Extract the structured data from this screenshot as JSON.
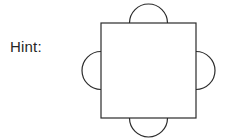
{
  "page": {
    "background_color": "#ffffff",
    "width": 230,
    "height": 139
  },
  "label": {
    "hint_text": "Hint:",
    "color": "#262626",
    "font_size_px": 15
  },
  "figure": {
    "name": "square-with-four-outward-semicircles",
    "stroke_color": "#2b2b2b",
    "fill_color": "#ffffff",
    "stroke_width_px": 1.2,
    "square": {
      "x": 101,
      "y": 23,
      "width": 95,
      "height": 95
    },
    "semicircles": [
      {
        "position": "top",
        "center_x": 148.5,
        "center_y": 23,
        "radius": 19,
        "bulge": "outward-up"
      },
      {
        "position": "right",
        "center_x": 196,
        "center_y": 70.5,
        "radius": 19,
        "bulge": "outward-right"
      },
      {
        "position": "bottom",
        "center_x": 148.5,
        "center_y": 118,
        "radius": 19,
        "bulge": "outward-down"
      },
      {
        "position": "left",
        "center_x": 101,
        "center_y": 70.5,
        "radius": 19,
        "bulge": "outward-left"
      }
    ]
  }
}
